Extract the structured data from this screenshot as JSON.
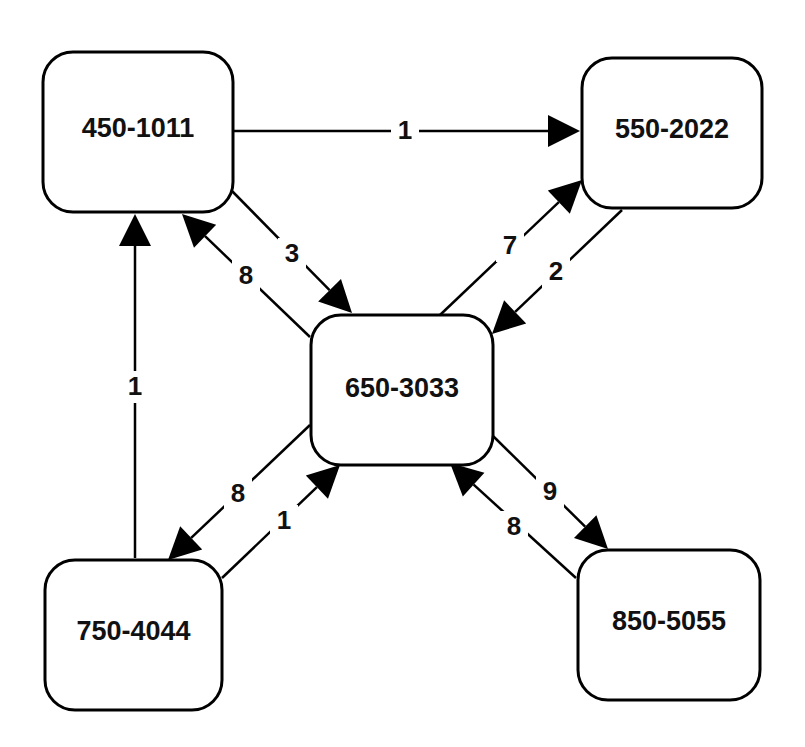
{
  "diagram": {
    "nodes": [
      {
        "id": "n450",
        "label": "450-1011"
      },
      {
        "id": "n550",
        "label": "550-2022"
      },
      {
        "id": "n650",
        "label": "650-3033"
      },
      {
        "id": "n750",
        "label": "750-4044"
      },
      {
        "id": "n850",
        "label": "850-5055"
      }
    ],
    "edges": [
      {
        "from": "n450",
        "to": "n550",
        "label": "1"
      },
      {
        "from": "n450",
        "to": "n650",
        "label": "3"
      },
      {
        "from": "n650",
        "to": "n450",
        "label": "8"
      },
      {
        "from": "n650",
        "to": "n550",
        "label": "7"
      },
      {
        "from": "n550",
        "to": "n650",
        "label": "2"
      },
      {
        "from": "n750",
        "to": "n450",
        "label": "1"
      },
      {
        "from": "n650",
        "to": "n750",
        "label": "8"
      },
      {
        "from": "n750",
        "to": "n650",
        "label": "1"
      },
      {
        "from": "n650",
        "to": "n850",
        "label": "9"
      },
      {
        "from": "n850",
        "to": "n650",
        "label": "8"
      }
    ],
    "colors": {
      "stroke": "#000000",
      "fill": "#ffffff",
      "text": "#111111"
    }
  }
}
